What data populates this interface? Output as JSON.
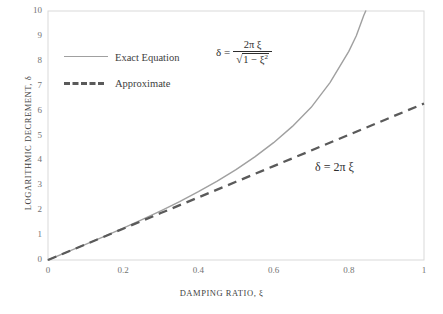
{
  "chart_data": {
    "type": "line",
    "title": "",
    "xlabel": "DAMPING  RATIO,  ξ",
    "ylabel": "LOGARITHMIC DECREMENT, δ",
    "xlim": [
      0,
      1
    ],
    "ylim": [
      0,
      10
    ],
    "xticks": [
      "0",
      "0.2",
      "0.4",
      "0.6",
      "0.8",
      "1"
    ],
    "xtick_values": [
      0,
      0.2,
      0.4,
      0.6,
      0.8,
      1
    ],
    "yticks": [
      "0",
      "1",
      "2",
      "3",
      "4",
      "5",
      "6",
      "7",
      "8",
      "9",
      "10"
    ],
    "ytick_values": [
      0,
      1,
      2,
      3,
      4,
      5,
      6,
      7,
      8,
      9,
      10
    ],
    "grid": false,
    "legend_position": "upper left",
    "series": [
      {
        "name": "Exact Equation",
        "style": "solid",
        "color": "#a0a0a0",
        "formula": "delta = 2*pi*xi / sqrt(1 - xi^2)",
        "x": [
          0,
          0.05,
          0.1,
          0.15,
          0.2,
          0.25,
          0.3,
          0.35,
          0.4,
          0.45,
          0.5,
          0.55,
          0.6,
          0.65,
          0.7,
          0.75,
          0.8,
          0.82,
          0.84,
          0.845
        ],
        "values": [
          0,
          0.314,
          0.631,
          0.953,
          1.283,
          1.622,
          1.976,
          2.348,
          2.742,
          3.166,
          3.628,
          4.14,
          4.712,
          5.366,
          6.13,
          7.124,
          8.378,
          9.004,
          9.83,
          10.0
        ]
      },
      {
        "name": "Approximate",
        "style": "dashed",
        "color": "#5a5a5a",
        "formula": "delta = 2*pi*xi",
        "x": [
          0,
          0.1,
          0.2,
          0.3,
          0.4,
          0.5,
          0.6,
          0.7,
          0.8,
          0.9,
          1
        ],
        "values": [
          0,
          0.628,
          1.257,
          1.885,
          2.513,
          3.142,
          3.77,
          4.398,
          5.027,
          5.655,
          6.283
        ]
      }
    ],
    "annotations": [
      {
        "name": "exact-equation-formula",
        "lhs": "δ =",
        "numerator": "2π ξ",
        "denominator_radicand": "1 − ξ",
        "denominator_exponent": "2",
        "x": 0.62,
        "y": 8.3
      },
      {
        "name": "approximate-equation-formula",
        "text": "δ = 2π ξ",
        "x": 0.79,
        "y": 3.7
      }
    ]
  },
  "legend": {
    "items": [
      {
        "label": "Exact Equation",
        "style": "solid"
      },
      {
        "label": "Approximate",
        "style": "dashed"
      }
    ]
  },
  "colors": {
    "exact_line": "#a0a0a0",
    "approximate_line": "#5a5a5a",
    "axis": "#d4d4d4",
    "tick_text": "#737373",
    "title_text": "#3f3f3f",
    "background": "#ffffff"
  }
}
